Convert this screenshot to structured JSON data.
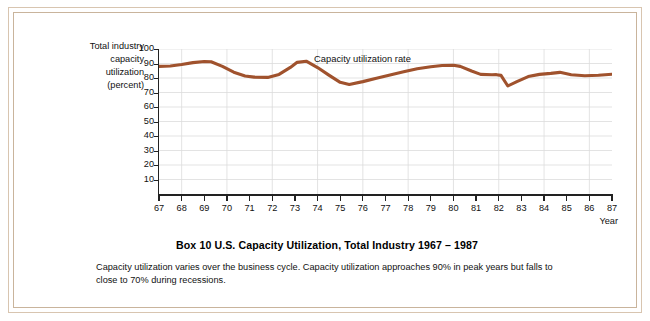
{
  "figure": {
    "title": "Box 10     U.S. Capacity Utilization, Total Industry  1967 – 1987",
    "caption": "Capacity utilization varies over the business cycle. Capacity utilization approaches 90% in peak years but falls to close to 70% during recessions.",
    "border_color": "#c9b49c",
    "background": "#ffffff"
  },
  "chart_data": {
    "type": "line",
    "annotation": "Capacity utilization rate",
    "xlabel": "Year",
    "ylabel_lines": [
      "Total industry",
      "capacity",
      "utilization",
      "(percent)"
    ],
    "series_color": "#a0522d",
    "grid": true,
    "legend_position": "inline-annotation",
    "xlim": [
      67,
      87
    ],
    "ylim": [
      0,
      100
    ],
    "yticks": [
      100,
      90,
      80,
      70,
      60,
      50,
      40,
      30,
      20,
      10
    ],
    "xticks": [
      "67",
      "68",
      "69",
      "70",
      "71",
      "72",
      "73",
      "74",
      "75",
      "76",
      "77",
      "78",
      "79",
      "80",
      "81",
      "82",
      "83",
      "84",
      "85",
      "86",
      "87"
    ],
    "x": [
      67,
      67.5,
      68,
      68.5,
      69,
      69.3,
      69.8,
      70.3,
      70.8,
      71.2,
      71.8,
      72.3,
      72.8,
      73.1,
      73.5,
      74,
      74.5,
      75,
      75.4,
      76,
      76.6,
      77.2,
      77.8,
      78.4,
      79,
      79.5,
      80,
      80.3,
      80.8,
      81.2,
      81.7,
      81.9,
      82.1,
      82.4,
      82.8,
      83.3,
      83.8,
      84.3,
      84.7,
      85.2,
      85.8,
      86.4,
      87
    ],
    "y": [
      88.0,
      88.3,
      89.3,
      90.6,
      91.4,
      91.2,
      88.0,
      84.0,
      81.4,
      80.6,
      80.4,
      82.5,
      87.3,
      90.8,
      91.6,
      87.2,
      82.0,
      77.0,
      75.5,
      77.5,
      79.8,
      82.0,
      84.3,
      86.4,
      87.8,
      88.6,
      88.8,
      88.0,
      84.8,
      82.5,
      82.2,
      82.3,
      81.8,
      74.5,
      77.5,
      81.0,
      82.5,
      83.2,
      83.9,
      82.2,
      81.6,
      81.9,
      82.6
    ],
    "series_name": "Capacity utilization rate",
    "peaks": [
      {
        "year": 1969,
        "value": 91.4
      },
      {
        "year": 1973,
        "value": 91.6
      },
      {
        "year": 1979,
        "value": 88.8
      }
    ],
    "troughs": [
      {
        "year": 1971,
        "value": 80.4
      },
      {
        "year": 1975,
        "value": 75.5
      },
      {
        "year": 1982,
        "value": 74.5
      }
    ]
  }
}
